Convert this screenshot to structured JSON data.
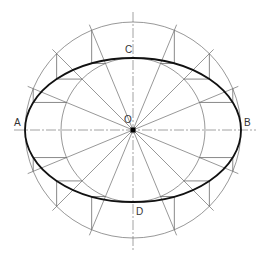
{
  "diagram": {
    "center": {
      "x": 133,
      "y": 130
    },
    "outer_circle_radius": 108,
    "inner_circle_radius": 72,
    "semi_major": 108,
    "semi_minor": 72,
    "radial_step_deg": 22.5,
    "colors": {
      "construction": "#6b6b6b",
      "ellipse": "#111111",
      "axis": "#8a8a8a"
    }
  },
  "labels": {
    "A": "A",
    "B": "B",
    "C": "C",
    "D": "D",
    "O": "O"
  }
}
